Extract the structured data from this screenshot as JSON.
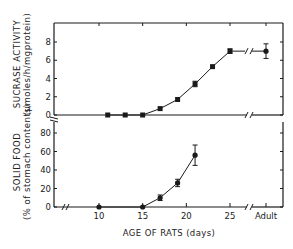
{
  "chart_data": [
    {
      "type": "line",
      "panel": "top",
      "title": "",
      "ylabel": "SUCRASE ACTIVITY",
      "ylabel_units": "(µmoles/h/mgprotein)",
      "xlabel": "AGE OF RATS (days)",
      "ylim": [
        0,
        10
      ],
      "yticks": [
        0,
        2,
        4,
        6,
        8
      ],
      "x_tick_labels": [
        "10",
        "15",
        "20",
        "25",
        "Adult"
      ],
      "axis_break_x": true,
      "series": [
        {
          "name": "Sucrase activity",
          "marker": "square",
          "x": [
            11,
            13,
            15,
            17,
            19,
            21,
            23,
            25,
            "Adult"
          ],
          "values": [
            0,
            0,
            0,
            0.7,
            1.7,
            3.4,
            5.3,
            7.0,
            7.0
          ],
          "error": [
            0,
            0,
            0,
            0.1,
            0.1,
            0.3,
            0.15,
            0.25,
            0.8
          ]
        }
      ]
    },
    {
      "type": "line",
      "panel": "bottom",
      "title": "",
      "ylabel": "SOLID FOOD",
      "ylabel_units": "(% of stomach contents)",
      "xlabel": "AGE OF RATS (days)",
      "ylim": [
        0,
        90
      ],
      "yticks": [
        0,
        20,
        40,
        60,
        80
      ],
      "x_tick_labels": [
        "10",
        "15",
        "20",
        "25",
        "Adult"
      ],
      "axis_break_x": true,
      "series": [
        {
          "name": "Solid food",
          "marker": "circle",
          "x": [
            10,
            15,
            17,
            19,
            21
          ],
          "values": [
            0,
            0,
            10,
            26,
            56
          ],
          "error": [
            0,
            0,
            3,
            4,
            11
          ]
        }
      ]
    }
  ],
  "labels": {
    "top_ylabel": "SUCRASE ACTIVITY",
    "top_ylabel_units": "(µmoles/h/mgprotein)",
    "bottom_ylabel": "SOLID FOOD",
    "bottom_ylabel_units": "(% of stomach contents)",
    "xlabel": "AGE OF RATS  (days)"
  }
}
